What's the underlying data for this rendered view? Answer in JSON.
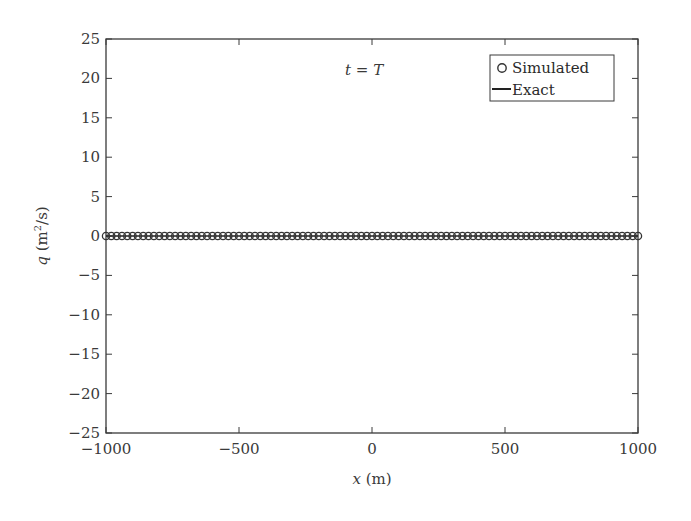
{
  "chart_data": {
    "type": "scatter",
    "title": "",
    "annotation": {
      "text_italic_left": "t",
      "text_mid": " = ",
      "text_italic_right": "T"
    },
    "xlabel": {
      "var": "x",
      "unit": " (m)"
    },
    "ylabel": {
      "var": "q",
      "unit_pre": " (m",
      "unit_sup": "2",
      "unit_post": "/s)"
    },
    "xlim": [
      -1000,
      1000
    ],
    "ylim": [
      -25,
      25
    ],
    "xticks": [
      -1000,
      -500,
      0,
      500,
      1000
    ],
    "xtick_labels": [
      "−1000",
      "−500",
      "0",
      "500",
      "1000"
    ],
    "yticks": [
      25,
      20,
      15,
      10,
      5,
      0,
      -5,
      -10,
      -15,
      -20,
      -25
    ],
    "ytick_labels": [
      "25",
      "20",
      "15",
      "10",
      "5",
      "0",
      "−5",
      "−10",
      "−15",
      "−20",
      "−25"
    ],
    "grid": false,
    "legend": {
      "position": "upper right",
      "entries": [
        {
          "label": "Simulated",
          "marker": "open-circle"
        },
        {
          "label": "Exact",
          "marker": "solid-line"
        }
      ]
    },
    "series": [
      {
        "name": "Simulated",
        "style": "open-circle-markers",
        "x_start": -1000,
        "x_end": 1000,
        "x_step": 20,
        "y_constant": 0
      },
      {
        "name": "Exact",
        "style": "solid-line",
        "x": [
          -1000,
          1000
        ],
        "y": [
          0,
          0
        ]
      }
    ],
    "colors": {
      "axes": "#3a3a3a",
      "markers": "#333333",
      "line": "#222222"
    }
  }
}
